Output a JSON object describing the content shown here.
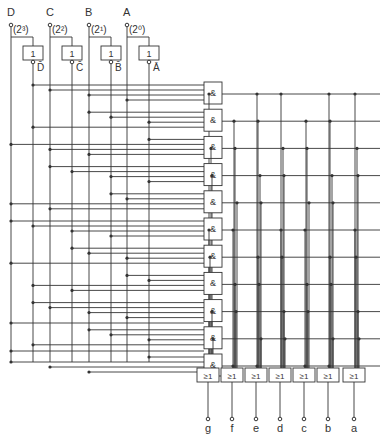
{
  "inputs": [
    {
      "name": "D",
      "weight": "(2³)",
      "inv": "D̄",
      "x": 11,
      "gx": 20
    },
    {
      "name": "C",
      "weight": "(2²)",
      "inv": "C̄",
      "x": 50,
      "gx": 59
    },
    {
      "name": "B",
      "weight": "(2¹)",
      "inv": "B̄",
      "x": 89,
      "gx": 98
    },
    {
      "name": "A",
      "weight": "(2⁰)",
      "inv": "Ā",
      "x": 127,
      "gx": 136
    }
  ],
  "not_gate_label": "1",
  "and_gate_label": "&",
  "and_gate_count": 11,
  "or_gate_label": "≥1",
  "outputs": [
    "g",
    "f",
    "e",
    "d",
    "c",
    "b",
    "a"
  ],
  "colors": {
    "line": "#333333",
    "bg": "#ffffff"
  }
}
